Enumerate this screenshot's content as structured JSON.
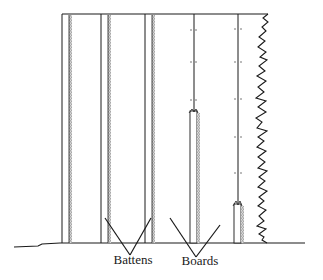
{
  "diagram": {
    "labels": {
      "battens": "Battens",
      "boards": "Boards"
    },
    "colors": {
      "ink": "#1a1a1a",
      "background": "#ffffff"
    }
  }
}
